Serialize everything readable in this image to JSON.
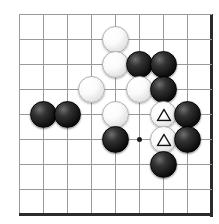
{
  "diagram": {
    "type": "go-board-diagram",
    "board": {
      "visible_columns": 9,
      "visible_rows": 9,
      "origin_x": 19,
      "origin_y": 14,
      "spacing_x": 24,
      "spacing_y": 25,
      "line_color": "#9a9a9a",
      "edge_color": "#2b2b2b",
      "background_color": "#ffffff",
      "right_edge_is_board_border": true,
      "bottom_edge_is_board_border": true
    },
    "star_points": [
      {
        "label": "hoshi",
        "col": 5,
        "row": 5
      }
    ],
    "stones": [
      {
        "id": "w1",
        "color": "white",
        "col": 4,
        "row": 1,
        "marker": ""
      },
      {
        "id": "w2",
        "color": "white",
        "col": 4,
        "row": 2,
        "marker": ""
      },
      {
        "id": "b1",
        "color": "black",
        "col": 5,
        "row": 2,
        "marker": ""
      },
      {
        "id": "b2",
        "color": "black",
        "col": 6,
        "row": 2,
        "marker": ""
      },
      {
        "id": "w3",
        "color": "white",
        "col": 3,
        "row": 3,
        "marker": ""
      },
      {
        "id": "w4",
        "color": "white",
        "col": 5,
        "row": 3,
        "marker": ""
      },
      {
        "id": "b3",
        "color": "black",
        "col": 6,
        "row": 3,
        "marker": ""
      },
      {
        "id": "b4",
        "color": "black",
        "col": 1,
        "row": 4,
        "marker": ""
      },
      {
        "id": "b5",
        "color": "black",
        "col": 2,
        "row": 4,
        "marker": ""
      },
      {
        "id": "w5",
        "color": "white",
        "col": 4,
        "row": 4,
        "marker": ""
      },
      {
        "id": "w6",
        "color": "white",
        "col": 6,
        "row": 4,
        "marker": "triangle"
      },
      {
        "id": "b6",
        "color": "black",
        "col": 7,
        "row": 4,
        "marker": ""
      },
      {
        "id": "b7",
        "color": "black",
        "col": 4,
        "row": 5,
        "marker": ""
      },
      {
        "id": "w7",
        "color": "white",
        "col": 6,
        "row": 5,
        "marker": "triangle"
      },
      {
        "id": "b8",
        "color": "black",
        "col": 7,
        "row": 5,
        "marker": ""
      },
      {
        "id": "b9",
        "color": "black",
        "col": 6,
        "row": 6,
        "marker": ""
      }
    ],
    "colors": {
      "black_stone": "#111111",
      "white_stone": "#fdfdfd",
      "grid": "#9a9a9a",
      "border": "#2b2b2b",
      "marker_stroke": "#111111"
    }
  }
}
